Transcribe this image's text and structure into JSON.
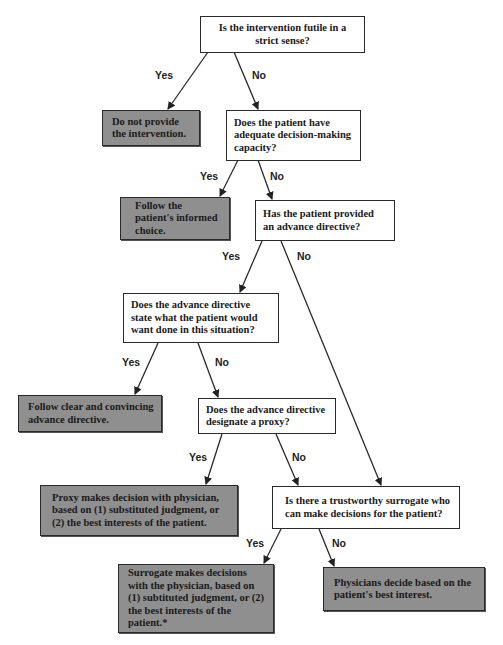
{
  "diagram": {
    "type": "decision-flowchart",
    "colors": {
      "question_fill": "#ffffff",
      "answer_fill": "#8f8f8f",
      "stroke": "#2a2a2a"
    },
    "nodes": {
      "q1": "Is the intervention futile in a strict sense?",
      "a1": "Do not provide the intervention.",
      "q2": "Does the patient have adequate decision-making capacity?",
      "a2": "Follow the patient's informed choice.",
      "q3": "Has the patient provided an advance directive?",
      "q4": "Does the advance directive state what the patient would want done in this situation?",
      "a4": "Follow clear and convincing advance directive.",
      "q5": "Does the advance directive designate a proxy?",
      "a5": "Proxy makes decision with physician, based on (1) substituted judgment, or (2) the best interests of the patient.",
      "q6": "Is there a trustworthy surrogate who can make decisions for the patient?",
      "a6_yes": "Surrogate makes decisions with the physician, based on (1) subtituted judgment, or (2) the best interests of the patient.*",
      "a6_no": "Physicians decide based on the patient's best interest."
    },
    "edge_labels": {
      "q1_yes": "Yes",
      "q1_no": "No",
      "q2_yes": "Yes",
      "q2_no": "No",
      "q3_yes": "Yes",
      "q3_no": "No",
      "q4_yes": "Yes",
      "q4_no": "No",
      "q5_yes": "Yes",
      "q5_no": "No",
      "q6_yes": "Yes",
      "q6_no": "No"
    },
    "edges": [
      {
        "from": "q1",
        "to": "a1",
        "label": "Yes"
      },
      {
        "from": "q1",
        "to": "q2",
        "label": "No"
      },
      {
        "from": "q2",
        "to": "a2",
        "label": "Yes"
      },
      {
        "from": "q2",
        "to": "q3",
        "label": "No"
      },
      {
        "from": "q3",
        "to": "q4",
        "label": "Yes"
      },
      {
        "from": "q3",
        "to": "q6",
        "label": "No"
      },
      {
        "from": "q4",
        "to": "a4",
        "label": "Yes"
      },
      {
        "from": "q4",
        "to": "q5",
        "label": "No"
      },
      {
        "from": "q5",
        "to": "a5",
        "label": "Yes"
      },
      {
        "from": "q5",
        "to": "q6",
        "label": "No"
      },
      {
        "from": "q6",
        "to": "a6_yes",
        "label": "Yes"
      },
      {
        "from": "q6",
        "to": "a6_no",
        "label": "No"
      }
    ]
  }
}
